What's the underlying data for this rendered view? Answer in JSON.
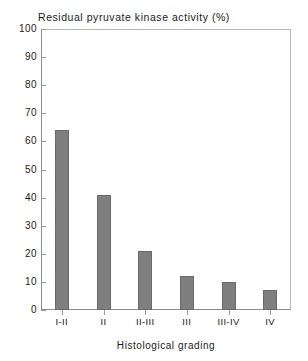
{
  "chart_data": {
    "type": "bar",
    "title": "Residual pyruvate kinase activity (%)",
    "xlabel": "Histological grading",
    "ylabel": "",
    "categories": [
      "I-II",
      "II",
      "II-III",
      "III",
      "III-IV",
      "IV"
    ],
    "values": [
      64,
      41,
      21,
      12,
      10,
      7
    ],
    "ylim": [
      0,
      100
    ],
    "yticks": [
      0,
      10,
      20,
      30,
      40,
      50,
      60,
      70,
      80,
      90,
      100
    ],
    "ytick_labels": [
      "0",
      "10",
      "20",
      "30",
      "40",
      "50",
      "60",
      "70",
      "80",
      "90",
      "100"
    ],
    "grid": false,
    "legend": "none",
    "bar_color": "#7f7f7f",
    "bar_edge_color": "#6a6a6a",
    "axis_color": "#8c8c8c",
    "background_color": "#ffffff"
  }
}
